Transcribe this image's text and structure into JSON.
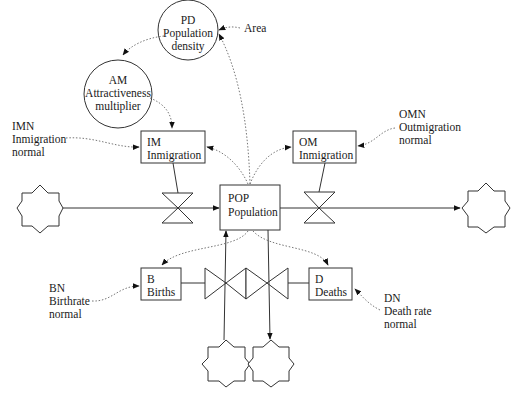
{
  "diagram": {
    "type": "stock-flow",
    "stock": {
      "code": "POP",
      "name": "Population"
    },
    "flows": {
      "im": {
        "code": "IM",
        "name": "Inmigration"
      },
      "om": {
        "code": "OM",
        "name": "Inmigration"
      },
      "b": {
        "code": "B",
        "name": "Births"
      },
      "d": {
        "code": "D",
        "name": "Deaths"
      }
    },
    "auxiliaries": {
      "pd": {
        "code": "PD",
        "line1": "Population",
        "line2": "density"
      },
      "am": {
        "code": "AM",
        "line1": "Attractiveness",
        "line2": "multiplier"
      }
    },
    "constants": {
      "area": {
        "label": "Area"
      },
      "imn": {
        "code": "IMN",
        "line1": "Inmigration",
        "line2": "normal"
      },
      "omn": {
        "code": "OMN",
        "line1": "Outmigration",
        "line2": "normal"
      },
      "bn": {
        "code": "BN",
        "line1": "Birthrate",
        "line2": "normal"
      },
      "dn": {
        "code": "DN",
        "line1": "Death rate",
        "line2": "normal"
      }
    },
    "sources_sinks": [
      "left-source",
      "right-sink",
      "birth-source",
      "death-sink"
    ]
  }
}
